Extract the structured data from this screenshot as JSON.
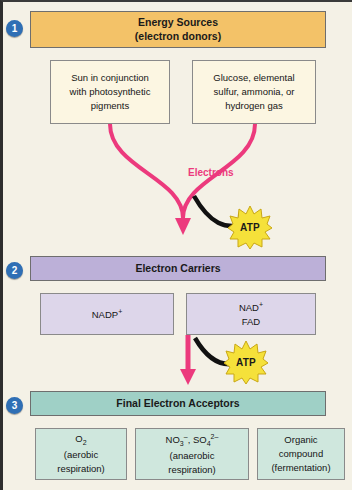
{
  "diagram": {
    "background_color": "#f4f1e6",
    "accent_pink": "#ec3a7d",
    "step_circle_color": "#2f6fb5"
  },
  "steps": [
    {
      "number": "1",
      "banner": "Energy Sources\n(electron donors)",
      "banner_line1": "Energy Sources",
      "banner_line2": "(electron donors)",
      "banner_color": "#f3c268",
      "boxes": [
        {
          "text": "Sun in conjunction with photosynthetic pigments"
        },
        {
          "text": "Glucose, elemental sulfur, ammonia, or hydrogen gas"
        }
      ]
    },
    {
      "number": "2",
      "banner_line1": "Electron Carriers",
      "banner_color": "#bcb0d8",
      "boxes": [
        {
          "text": "NADP+"
        },
        {
          "text": "NAD+ FAD"
        }
      ]
    },
    {
      "number": "3",
      "banner_line1": "Final Electron Acceptors",
      "banner_color": "#9fd0c6",
      "boxes": [
        {
          "text": "O2 (aerobic respiration)"
        },
        {
          "text": "NO3-, SO4 2- (anaerobic respiration)"
        },
        {
          "text": "Organic compound (fermentation)"
        }
      ]
    }
  ],
  "labels": {
    "electrons": "Electrons",
    "atp_top": "ATP",
    "atp_bottom": "ATP"
  },
  "box_text": {
    "sun": "Sun in conjunction",
    "sun2": "with photosynthetic",
    "sun3": "pigments",
    "glucose1": "Glucose, elemental",
    "glucose2": "sulfur, ammonia, or",
    "glucose3": "hydrogen gas",
    "nadp": "NADP",
    "nadp_sup": "+",
    "nad": "NAD",
    "nad_sup": "+",
    "fad": "FAD",
    "o2_main": "O",
    "o2_sub": "2",
    "o2_note": "(aerobic",
    "o2_note2": "respiration)",
    "no3": "NO",
    "no3_sub": "3",
    "no3_sup": "–",
    "comma": ", ",
    "so4": "SO",
    "so4_sub": "4",
    "so4_sup": "2–",
    "anaerobic1": "(anaerobic",
    "anaerobic2": "respiration)",
    "organic1": "Organic",
    "organic2": "compound",
    "organic3": "(fermentation)"
  }
}
